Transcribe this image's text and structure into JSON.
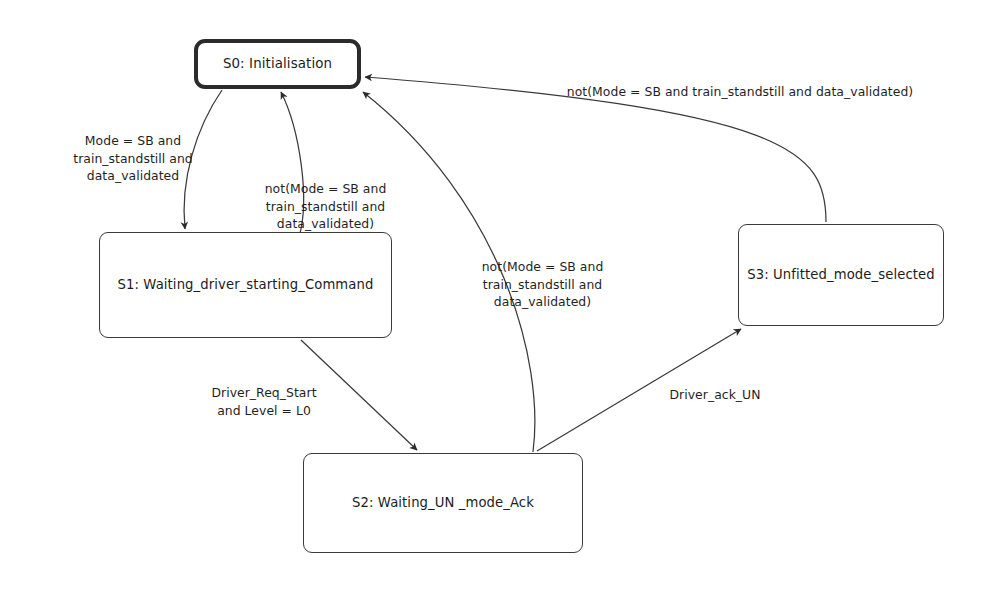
{
  "diagram": {
    "type": "state-machine",
    "background_color": "#ffffff",
    "stroke_color": "#3a3a3a",
    "text_color": "#1c1c1c",
    "states": [
      {
        "id": "S0",
        "label": "S0: Initialisation",
        "is_initial": true,
        "x": 194,
        "y": 39,
        "width": 167,
        "height": 50
      },
      {
        "id": "S1",
        "label": "S1: Waiting_driver_starting_Command",
        "is_initial": false,
        "x": 99,
        "y": 232,
        "width": 293,
        "height": 106
      },
      {
        "id": "S2",
        "label": "S2: Waiting_UN _mode_Ack",
        "is_initial": false,
        "x": 303,
        "y": 453,
        "width": 280,
        "height": 100
      },
      {
        "id": "S3",
        "label": "S3: Unfitted_mode_selected",
        "is_initial": false,
        "x": 738,
        "y": 224,
        "width": 206,
        "height": 102
      }
    ],
    "transitions": [
      {
        "id": "t-s0-s1",
        "from": "S0",
        "to": "S1",
        "label": "Mode = SB and\ntrain_standstill and\ndata_validated",
        "label_x": 48,
        "label_y": 132,
        "label_width": 170
      },
      {
        "id": "t-s1-s0",
        "from": "S1",
        "to": "S0",
        "label": "not(Mode = SB and\ntrain_standstill and\ndata_validated)",
        "label_x": 238,
        "label_y": 180,
        "label_width": 175
      },
      {
        "id": "t-s1-s2",
        "from": "S1",
        "to": "S2",
        "label": "Driver_Req_Start\nand Level = L0",
        "label_x": 190,
        "label_y": 384,
        "label_width": 148
      },
      {
        "id": "t-s2-s0",
        "from": "S2",
        "to": "S0",
        "label": "not(Mode = SB and\ntrain_standstill and\ndata_validated)",
        "label_x": 455,
        "label_y": 258,
        "label_width": 175
      },
      {
        "id": "t-s2-s3",
        "from": "S2",
        "to": "S3",
        "label": "Driver_ack_UN",
        "label_x": 650,
        "label_y": 386,
        "label_width": 130
      },
      {
        "id": "t-s3-s0",
        "from": "S3",
        "to": "S0",
        "label": "not(Mode = SB and train_standstill and data_validated)",
        "label_x": 545,
        "label_y": 83,
        "label_width": 390
      }
    ]
  }
}
